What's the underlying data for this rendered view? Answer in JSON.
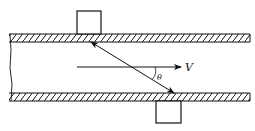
{
  "diagram": {
    "type": "ultrasonic-transit-time-flowmeter",
    "labels": {
      "velocity": "V",
      "angle": "θ"
    },
    "components": [
      {
        "name": "pipe-top-wall",
        "hatched": true
      },
      {
        "name": "pipe-bottom-wall",
        "hatched": true
      },
      {
        "name": "upstream-transducer",
        "position": "top"
      },
      {
        "name": "downstream-transducer",
        "position": "bottom"
      },
      {
        "name": "acoustic-path",
        "bidirectional": true
      },
      {
        "name": "flow-velocity-arrow"
      }
    ],
    "colors": {
      "stroke": "#111111",
      "background": "#ffffff"
    }
  }
}
